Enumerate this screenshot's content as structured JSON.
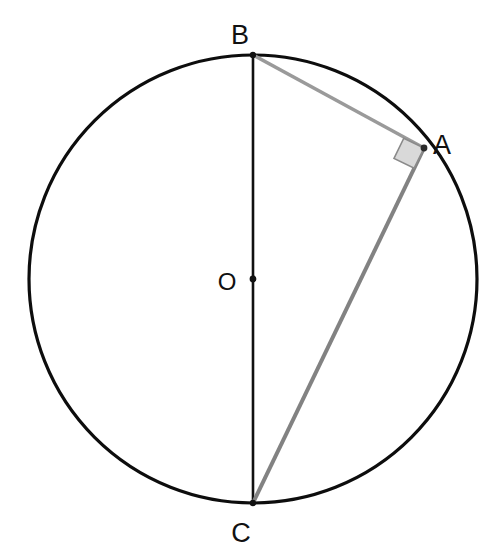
{
  "figure": {
    "background_color": "#ffffff",
    "width": 493,
    "height": 556
  },
  "circle": {
    "name": "circumscribed-circle",
    "center_x": 253,
    "center_y": 279,
    "radius": 224,
    "stroke_color": "#0d0d0d",
    "stroke_width": 3.2,
    "fill": "none"
  },
  "center_point": {
    "label": "O",
    "x": 253,
    "y": 279,
    "dot_radius": 3.4,
    "dot_color": "#111111",
    "label_x": 227,
    "label_y": 290
  },
  "points": [
    {
      "id": "B",
      "label": "B",
      "x": 253,
      "y": 55,
      "label_x": 240,
      "label_y": 44,
      "dot_radius": 3.2,
      "dot_color": "#111111"
    },
    {
      "id": "A",
      "label": "A",
      "x": 424,
      "y": 148,
      "label_x": 433,
      "label_y": 154,
      "dot_radius": 3.4,
      "dot_color": "#2b2b2b"
    },
    {
      "id": "C",
      "label": "C",
      "x": 253,
      "y": 503,
      "label_x": 241,
      "label_y": 542,
      "dot_radius": 3.2,
      "dot_color": "#111111"
    }
  ],
  "segments": [
    {
      "id": "BC",
      "name": "diameter-segment-bc",
      "from": "B",
      "to": "C",
      "x1": 253,
      "y1": 55,
      "x2": 253,
      "y2": 503,
      "stroke_color": "#111111",
      "stroke_width": 2.6
    },
    {
      "id": "BA",
      "name": "chord-segment-ba",
      "from": "B",
      "to": "A",
      "x1": 253,
      "y1": 55,
      "x2": 424,
      "y2": 148,
      "stroke_color": "#9a9a9a",
      "stroke_width": 3.4
    },
    {
      "id": "AC",
      "name": "chord-segment-ac",
      "from": "A",
      "to": "C",
      "x1": 424,
      "y1": 148,
      "x2": 253,
      "y2": 503,
      "stroke_color": "#828282",
      "stroke_width": 4.0
    }
  ],
  "right_angle_marker": {
    "name": "right-angle-square-at-a",
    "at_point": "A",
    "size": 22,
    "fill_color": "#d9d9d9",
    "stroke_color": "#8a8a8a",
    "stroke_width": 1.6,
    "points": "424,148 403.8,138.2 394.0,158.4 414.2,168.2"
  }
}
